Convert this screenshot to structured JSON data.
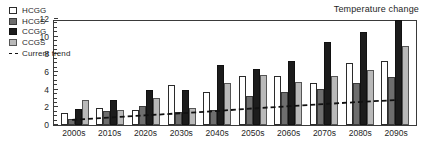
{
  "chart_data": {
    "type": "bar",
    "title": "Temperature change",
    "xlabel": "",
    "ylabel": "Temperature change (°F)",
    "ylim": [
      0,
      12
    ],
    "yticks": [
      0,
      2,
      4,
      6,
      8,
      10,
      12
    ],
    "grid": false,
    "legend_position": "top-left",
    "categories": [
      "2000s",
      "2010s",
      "2020s",
      "2030s",
      "2040s",
      "2050s",
      "2060s",
      "2070s",
      "2080s",
      "2090s"
    ],
    "series": [
      {
        "name": "HCGG",
        "values": [
          1.4,
          1.9,
          1.7,
          4.5,
          3.7,
          5.5,
          5.5,
          4.7,
          7.0,
          7.3
        ]
      },
      {
        "name": "HCGS",
        "values": [
          0.7,
          1.6,
          2.2,
          1.5,
          1.7,
          3.3,
          3.7,
          4.1,
          4.7,
          5.4
        ]
      },
      {
        "name": "CCGG",
        "values": [
          1.8,
          2.8,
          4.0,
          4.0,
          6.8,
          6.3,
          7.3,
          9.4,
          10.5,
          11.9
        ]
      },
      {
        "name": "CCGS",
        "values": [
          2.8,
          1.7,
          3.1,
          1.9,
          4.7,
          5.7,
          4.9,
          5.5,
          6.2,
          9.0
        ]
      }
    ],
    "trend_line": {
      "name": "Current trend",
      "style": "dashed",
      "values": [
        0.75,
        1.0,
        1.25,
        1.5,
        1.75,
        2.05,
        2.3,
        2.55,
        2.8,
        3.0
      ]
    }
  },
  "legend": {
    "items": [
      {
        "label": "HCGG",
        "swatch": "hcgg"
      },
      {
        "label": "HCGS",
        "swatch": "hcgs"
      },
      {
        "label": "CCGG",
        "swatch": "ccgg"
      },
      {
        "label": "CCGS",
        "swatch": "ccgs"
      },
      {
        "label": "Current trend",
        "swatch": "trend"
      }
    ]
  }
}
